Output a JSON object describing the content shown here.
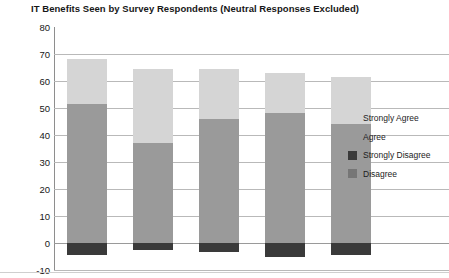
{
  "chart_data": {
    "type": "bar",
    "subtype": "stacked-diverging",
    "title": "IT Benefits Seen by Survey Respondents (Neutral Responses Excluded)",
    "xlabel": "",
    "ylabel": "",
    "ylim": [
      -10,
      80
    ],
    "ytick_step": 10,
    "yticks": [
      80,
      70,
      60,
      50,
      40,
      30,
      20,
      10,
      0,
      -10
    ],
    "ytick_labels": [
      "80",
      "70",
      "60",
      "50",
      "40",
      "30",
      "20",
      "10",
      "0",
      "-10"
    ],
    "grid": true,
    "legend_position": "right",
    "categories": [
      "1",
      "2",
      "3",
      "4",
      "5"
    ],
    "series": [
      {
        "name": "Strongly Agree",
        "color": "#d5d5d5",
        "values": [
          16.5,
          27.5,
          18.5,
          15.0,
          17.5
        ]
      },
      {
        "name": "Agree",
        "color": "#9a9a9a",
        "values": [
          51.5,
          37.0,
          46.0,
          48.0,
          44.0
        ]
      },
      {
        "name": "Strongly Disagree",
        "color": "#3a3a3a",
        "values": [
          -4.5,
          -2.5,
          -3.5,
          -5.0,
          -4.5
        ]
      },
      {
        "name": "Disagree",
        "color": "#767676",
        "values": [
          0,
          0,
          0,
          0,
          0
        ]
      }
    ],
    "bar_totals_positive": [
      68.0,
      64.5,
      64.5,
      63.0,
      61.5
    ],
    "legend_entries": [
      {
        "label": "Strongly Agree",
        "color": "#d5d5d5"
      },
      {
        "label": "Agree",
        "color": "#9a9a9a"
      },
      {
        "label": "Strongly Disagree",
        "color": "#3a3a3a"
      },
      {
        "label": "Disagree",
        "color": "#767676"
      }
    ]
  }
}
